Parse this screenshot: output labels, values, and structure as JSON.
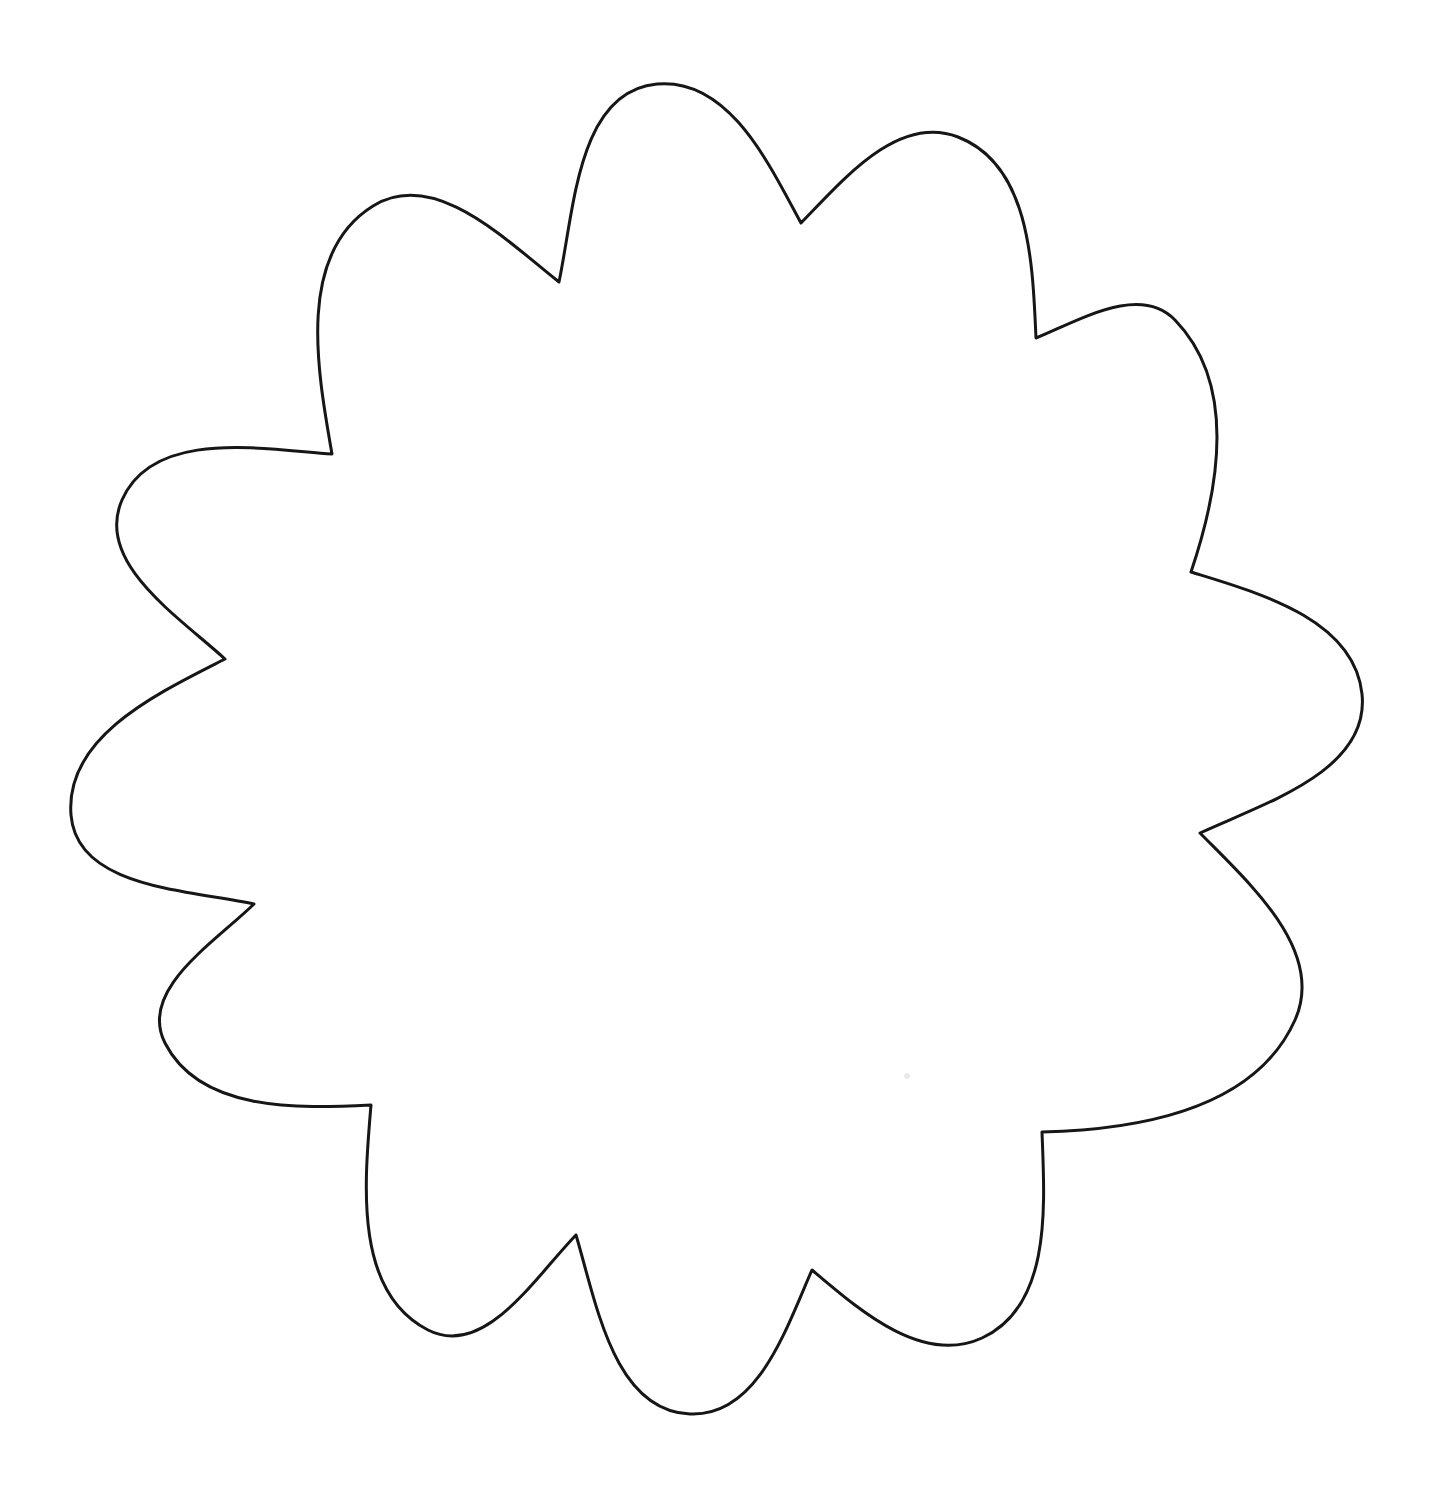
{
  "page": {
    "background_color": "#ffffff",
    "width": 1438,
    "height": 1506
  },
  "drawing": {
    "kind": "flower-outline-coloring-template",
    "petal_count": 12,
    "stroke_color": "#161616",
    "fill_color": "#ffffff",
    "stroke_width": 3,
    "center": {
      "x": 718,
      "y": 762
    },
    "petal_tips": [
      [
        657,
        84
      ],
      [
        958,
        137
      ],
      [
        1175,
        320
      ],
      [
        1362,
        694
      ],
      [
        1295,
        1020
      ],
      [
        982,
        1338
      ],
      [
        690,
        1414
      ],
      [
        428,
        1330
      ],
      [
        165,
        1043
      ],
      [
        71,
        815
      ],
      [
        122,
        500
      ],
      [
        373,
        206
      ]
    ],
    "petal_valleys": [
      [
        801,
        223
      ],
      [
        1036,
        338
      ],
      [
        1191,
        572
      ],
      [
        1200,
        833
      ],
      [
        1042,
        1132
      ],
      [
        812,
        1270
      ],
      [
        576,
        1235
      ],
      [
        371,
        1105
      ],
      [
        254,
        904
      ],
      [
        225,
        659
      ],
      [
        332,
        454
      ],
      [
        559,
        282
      ]
    ],
    "curve_style": {
      "valley_pull": 0.34,
      "tip_pull": 0.36,
      "valley_sharpness": 0.5
    }
  },
  "artifact_speck": {
    "x": 907,
    "y": 1076,
    "radius": 3,
    "color": "#dcdcdc",
    "opacity": 0.6
  }
}
